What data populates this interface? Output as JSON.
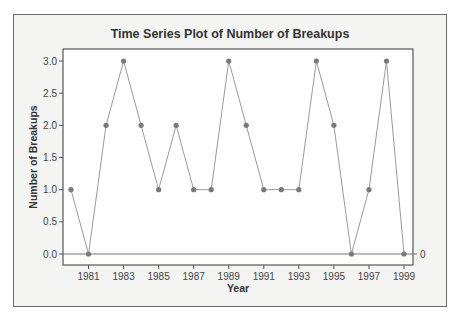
{
  "chart_data": {
    "type": "line",
    "title": "Time Series Plot of Number of Breakups",
    "xlabel": "Year",
    "ylabel": "Number of Breakups",
    "x": [
      1980,
      1981,
      1982,
      1983,
      1984,
      1985,
      1986,
      1987,
      1988,
      1989,
      1990,
      1991,
      1992,
      1993,
      1994,
      1995,
      1996,
      1997,
      1998,
      1999
    ],
    "series": [
      {
        "name": "Number of Breakups",
        "values": [
          1,
          0,
          2,
          3,
          2,
          1,
          2,
          1,
          1,
          3,
          2,
          1,
          1,
          1,
          3,
          2,
          0,
          1,
          3,
          0
        ]
      }
    ],
    "x_ticks": [
      "1981",
      "1983",
      "1985",
      "1987",
      "1989",
      "1991",
      "1993",
      "1995",
      "1997",
      "1999"
    ],
    "y_ticks": [
      "0.0",
      "0.5",
      "1.0",
      "1.5",
      "2.0",
      "2.5",
      "3.0"
    ],
    "ylim": [
      0,
      3
    ],
    "reference_line": {
      "value": 0,
      "label": "0"
    },
    "grid": false,
    "legend": null,
    "markers": true,
    "colors": {
      "line": "#9a9a9a",
      "marker": "#7a7a7a",
      "reference": "#777777"
    }
  }
}
